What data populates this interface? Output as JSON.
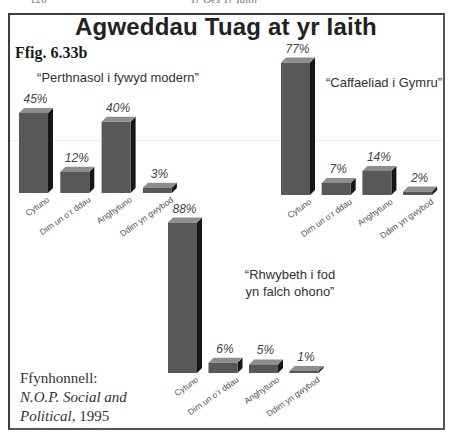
{
  "running_header": {
    "page_number": "126",
    "title": "Yr Oes Yr Iaith"
  },
  "figure": {
    "title": "Agweddau Tuag at yr Iaith",
    "label": "Ffig. 6.33b",
    "source": {
      "prefix": "Ffynhonnell:",
      "org_line1": "N.O.P. Social and",
      "org_line2": "Political",
      "year": ", 1995"
    }
  },
  "colors": {
    "front": "#585858",
    "side": "#161616",
    "top": "#8e8e8e",
    "text": "#444444"
  },
  "chart_data": [
    {
      "type": "bar",
      "title": "“Perthnasol i fywyd modern”",
      "categories": [
        "Cytuno",
        "Dim un o’r ddau",
        "Anghytuno",
        "Ddim yn gwybod"
      ],
      "values": [
        45,
        12,
        40,
        3
      ],
      "value_labels": [
        "45%",
        "12%",
        "40%",
        "3%"
      ],
      "unit": "%",
      "xlabel": "",
      "ylabel": "",
      "ylim": [
        0,
        100
      ],
      "grid": false,
      "legend": "none"
    },
    {
      "type": "bar",
      "title": "“Caffaeliad i Gymru”",
      "categories": [
        "Cytuno",
        "Dim un o’r ddau",
        "Anghytuno",
        "Ddim yn gwybod"
      ],
      "values": [
        77,
        7,
        14,
        2
      ],
      "value_labels": [
        "77%",
        "7%",
        "14%",
        "2%"
      ],
      "unit": "%",
      "xlabel": "",
      "ylabel": "",
      "ylim": [
        0,
        100
      ],
      "grid": false,
      "legend": "none"
    },
    {
      "type": "bar",
      "title_lines": [
        "“Rhwybeth i fod",
        "yn falch ohono”"
      ],
      "categories": [
        "Cytuno",
        "Dim un o’r ddau",
        "Anghytuno",
        "Ddim yn gwybod"
      ],
      "values": [
        88,
        6,
        5,
        1
      ],
      "value_labels": [
        "88%",
        "6%",
        "5%",
        "1%"
      ],
      "unit": "%",
      "xlabel": "",
      "ylabel": "",
      "ylim": [
        0,
        100
      ],
      "grid": false,
      "legend": "none"
    }
  ]
}
